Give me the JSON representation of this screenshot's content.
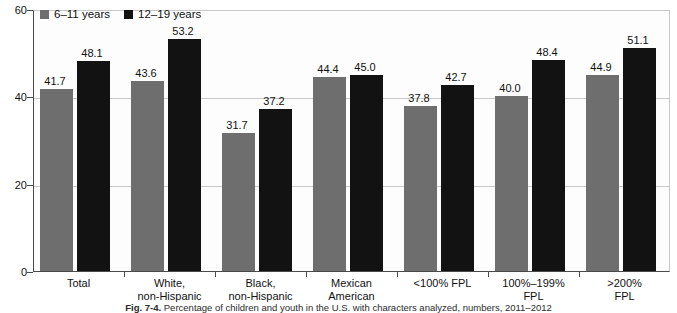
{
  "chart_data": {
    "type": "bar",
    "title": "",
    "xlabel": "",
    "ylabel": "",
    "ylim": [
      0,
      60
    ],
    "yticks": [
      0,
      20,
      40,
      60
    ],
    "grid": true,
    "legend_position": "top-left",
    "categories": [
      "Total",
      "White,\nnon-Hispanic",
      "Black,\nnon-Hispanic",
      "Mexican\nAmerican",
      "<100% FPL",
      "100%–199%\nFPL",
      ">200%\nFPL"
    ],
    "series": [
      {
        "name": "6–11 years",
        "color": "#6e6e6e",
        "values": [
          41.7,
          43.6,
          31.7,
          44.4,
          37.8,
          40.0,
          44.9
        ]
      },
      {
        "name": "12–19 years",
        "color": "#121212",
        "values": [
          48.1,
          53.2,
          37.2,
          45.0,
          42.7,
          48.4,
          51.1
        ]
      }
    ],
    "value_labels": [
      [
        "41.7",
        "48.1"
      ],
      [
        "43.6",
        "53.2"
      ],
      [
        "31.7",
        "37.2"
      ],
      [
        "44.4",
        "45.0"
      ],
      [
        "37.8",
        "42.7"
      ],
      [
        "40.0",
        "48.4"
      ],
      [
        "44.9",
        "51.1"
      ]
    ],
    "ytick_labels": [
      "0",
      "20",
      "40",
      "60"
    ]
  },
  "legend": {
    "items": [
      {
        "label": "6–11 years",
        "swatch": "series-a"
      },
      {
        "label": "12–19 years",
        "swatch": "series-b"
      }
    ]
  },
  "caption": {
    "label": "Fig. 7-4.",
    "text": "Percentage of children and youth in the U.S. with characters analyzed, numbers, 2011–2012"
  },
  "colors": {
    "series_a": "#6e6e6e",
    "series_b": "#121212",
    "axis": "#4a4a4a",
    "grid": "#c9c9c9",
    "background": "#ffffff"
  }
}
